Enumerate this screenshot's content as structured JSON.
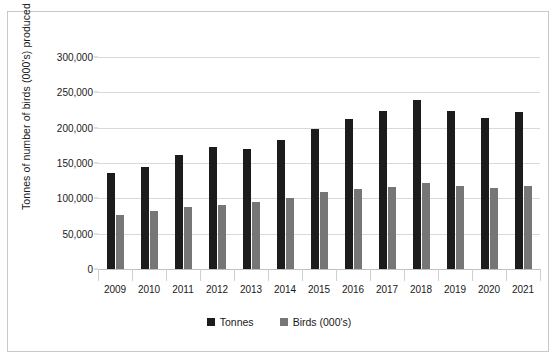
{
  "chart_data": {
    "type": "bar",
    "title": "",
    "subtitle": "",
    "xlabel": "",
    "ylabel": "Tonnes of  number of birds (000's) produced",
    "categories": [
      "2009",
      "2010",
      "2011",
      "2012",
      "2013",
      "2014",
      "2015",
      "2016",
      "2017",
      "2018",
      "2019",
      "2020",
      "2021"
    ],
    "series": [
      {
        "name": "Tonnes",
        "color": "#1c1c1c",
        "values": [
          136000,
          144000,
          161000,
          172000,
          170000,
          182000,
          198000,
          212000,
          223000,
          239000,
          223000,
          214000,
          222000
        ]
      },
      {
        "name": "Birds (000's)",
        "color": "#767676",
        "values": [
          77000,
          82000,
          88000,
          91000,
          95000,
          100000,
          109000,
          113000,
          116000,
          122000,
          117000,
          115000,
          117000
        ]
      }
    ],
    "ylim": [
      0,
      300000
    ],
    "ytick_values": [
      0,
      50000,
      100000,
      150000,
      200000,
      250000,
      300000
    ],
    "ytick_labels": [
      "0",
      "50,000",
      "100,000",
      "150,000",
      "200,000",
      "250,000",
      "300,000"
    ],
    "grid": true,
    "legend_position": "bottom",
    "legend_entries": [
      "Tonnes",
      "Birds (000's)"
    ]
  },
  "colors": {
    "tonnes": "#1c1c1c",
    "birds": "#767676",
    "gridline": "#d9d9d9",
    "axis": "#bfbfbf",
    "frame": "#c8c8c8",
    "text": "#1a1a1a",
    "background": "#ffffff"
  }
}
